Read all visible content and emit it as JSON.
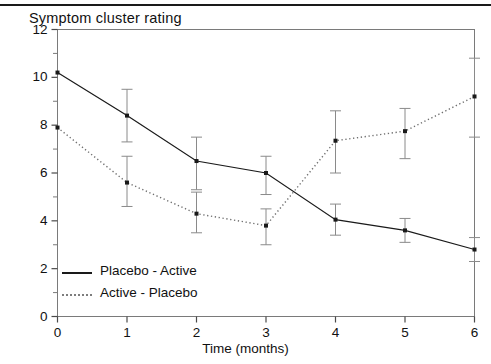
{
  "chart_data": {
    "type": "line",
    "title": "Symptom cluster rating",
    "xlabel": "Time (months)",
    "ylabel": "",
    "x": [
      0,
      1,
      2,
      3,
      4,
      5,
      6
    ],
    "xlim": [
      0,
      6
    ],
    "ylim": [
      0,
      12
    ],
    "xticks": [
      "0",
      "1",
      "2",
      "3",
      "4",
      "5",
      "6"
    ],
    "yticks": [
      "0",
      "2",
      "4",
      "6",
      "8",
      "10",
      "12"
    ],
    "y_minor_ticks": [
      1,
      3,
      5,
      7,
      9,
      11
    ],
    "grid": false,
    "legend_position": "inside lower-left",
    "series": [
      {
        "name": "Placebo - Active",
        "style": "solid",
        "color": "#1a1a1a",
        "marker": "square",
        "values": [
          10.2,
          8.4,
          6.5,
          6.0,
          4.05,
          3.6,
          2.8
        ],
        "err_low": [
          10.2,
          7.3,
          5.3,
          5.1,
          3.4,
          3.1,
          2.3
        ],
        "err_high": [
          10.2,
          9.5,
          7.5,
          6.7,
          4.7,
          4.1,
          3.3
        ]
      },
      {
        "name": "Active - Placebo",
        "style": "dotted",
        "color": "#6f6f6f",
        "marker": "square",
        "values": [
          7.9,
          5.6,
          4.3,
          3.8,
          7.35,
          7.75,
          9.2
        ],
        "err_low": [
          7.9,
          4.6,
          3.5,
          3.0,
          6.0,
          6.6,
          7.5
        ],
        "err_high": [
          7.9,
          6.7,
          5.2,
          4.5,
          8.6,
          8.7,
          10.8
        ]
      }
    ]
  },
  "legend": {
    "items": [
      {
        "label": "Placebo - Active",
        "style": "solid"
      },
      {
        "label": "Active - Placebo",
        "style": "dotted"
      }
    ]
  }
}
